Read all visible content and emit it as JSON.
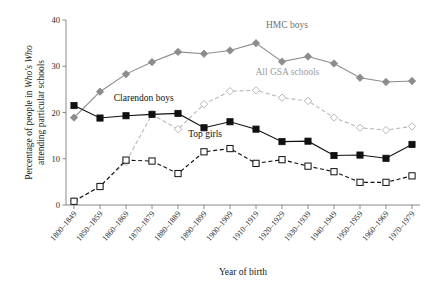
{
  "chart_data": {
    "type": "line",
    "title": "",
    "xlabel": "Year of birth",
    "ylabel_line1": "Percentage of people in Who's Who",
    "ylabel_line2": "attending particular schools",
    "ylabel_italic_part": "Who's Who",
    "ylim": [
      0,
      40
    ],
    "yticks": [
      0,
      10,
      20,
      30,
      40
    ],
    "grid": false,
    "legend_position": "inline-annotations",
    "categories": [
      "1800–1849",
      "1850–1859",
      "1860–1869",
      "1870–1879",
      "1880–1889",
      "1890–1899",
      "1900–1909",
      "1910–1919",
      "1920–1929",
      "1930–1939",
      "1940–1949",
      "1950–1959",
      "1960–1969",
      "1970–1979"
    ],
    "series": [
      {
        "name": "HMC boys",
        "color": "#8c8c8c",
        "marker": "filled-diamond",
        "dash": "solid",
        "values": [
          18.9,
          24.5,
          28.3,
          30.9,
          33.1,
          32.7,
          33.4,
          35.0,
          31.0,
          32.1,
          30.6,
          27.5,
          26.6,
          26.8
        ]
      },
      {
        "name": "All GSA schools",
        "color": "#b8b8b8",
        "marker": "open-diamond",
        "dash": "dashed",
        "values": [
          0.9,
          4.0,
          9.3,
          19.6,
          16.4,
          21.8,
          24.6,
          24.8,
          23.2,
          22.5,
          18.9,
          16.7,
          16.2,
          17.0
        ]
      },
      {
        "name": "Clarendon boys",
        "color": "#111111",
        "marker": "filled-square",
        "dash": "solid",
        "values": [
          21.5,
          18.8,
          19.3,
          19.6,
          19.8,
          16.7,
          18.0,
          16.4,
          13.7,
          13.8,
          10.7,
          10.8,
          10.1,
          13.1
        ]
      },
      {
        "name": "Top girls",
        "color": "#111111",
        "marker": "open-square",
        "dash": "dashed",
        "values": [
          0.8,
          4.0,
          9.7,
          9.5,
          6.8,
          11.5,
          12.2,
          9.0,
          9.8,
          8.4,
          7.2,
          4.9,
          4.9,
          6.3
        ]
      }
    ],
    "annotations": [
      {
        "text": "HMC boys",
        "x_frac": 0.565,
        "y_value": 38.3,
        "color": "#6f6f6f"
      },
      {
        "text": "All GSA schools",
        "x_frac": 0.535,
        "y_value": 28.2,
        "color": "#9c9c9c"
      },
      {
        "text": "Clarendon boys",
        "x_frac": 0.135,
        "y_value": 22.4,
        "color": "#111111"
      },
      {
        "text": "Top girls",
        "x_frac": 0.345,
        "y_value": 14.6,
        "color": "#111111"
      }
    ]
  }
}
